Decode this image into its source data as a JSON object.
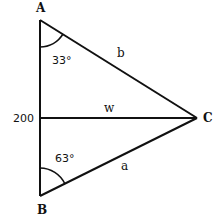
{
  "diagram": {
    "type": "triangle",
    "vertices": [
      {
        "name": "A",
        "x": 40,
        "y": 20,
        "label_x": 40,
        "label_y": 12
      },
      {
        "name": "B",
        "x": 40,
        "y": 196,
        "label_x": 41,
        "label_y": 213
      },
      {
        "name": "C",
        "x": 197,
        "y": 118,
        "label_x": 207,
        "label_y": 122
      }
    ],
    "sides": {
      "AB_length": "200",
      "AC_label": "b",
      "BC_label": "a",
      "median_label": "w"
    },
    "angles": {
      "A": "33°",
      "B": "63°"
    },
    "stroke_color": "#111111",
    "background": "#ffffff"
  }
}
